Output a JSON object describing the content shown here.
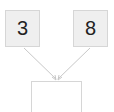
{
  "diagram": {
    "left_number": "3",
    "right_number": "8",
    "answer_value": "",
    "colors": {
      "box_fill": "#efefef",
      "border": "#d6d6d6",
      "arrow": "#c8c8c8"
    }
  }
}
